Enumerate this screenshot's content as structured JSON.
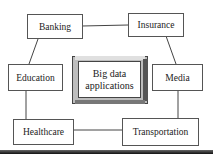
{
  "diagram": {
    "center": {
      "line1": "Big data",
      "line2": "applications"
    },
    "nodes": [
      {
        "id": "banking",
        "label": "Banking"
      },
      {
        "id": "insurance",
        "label": "Insurance"
      },
      {
        "id": "education",
        "label": "Education"
      },
      {
        "id": "media",
        "label": "Media"
      },
      {
        "id": "healthcare",
        "label": "Healthcare"
      },
      {
        "id": "transportation",
        "label": "Transportation"
      }
    ],
    "edges": [
      [
        "banking",
        "insurance"
      ],
      [
        "banking",
        "education"
      ],
      [
        "insurance",
        "media"
      ],
      [
        "education",
        "healthcare"
      ],
      [
        "media",
        "transportation"
      ],
      [
        "healthcare",
        "transportation"
      ]
    ]
  }
}
